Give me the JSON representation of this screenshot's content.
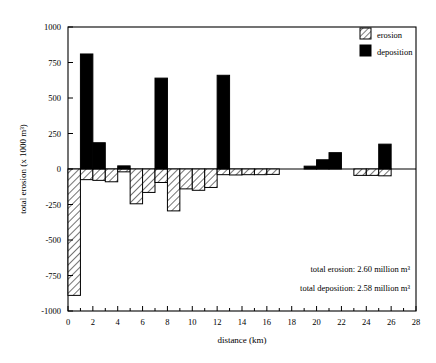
{
  "chart_data": {
    "type": "bar",
    "title": "",
    "xlabel": "distance (km)",
    "ylabel": "total erosion (x 1000 m³)",
    "xlim": [
      0,
      28
    ],
    "ylim": [
      -1000,
      1000
    ],
    "xticks": [
      0,
      2,
      4,
      6,
      8,
      10,
      12,
      14,
      16,
      18,
      20,
      22,
      24,
      26,
      28
    ],
    "xtick_labels": [
      "0",
      "2",
      "4",
      "6",
      "8",
      "10",
      "12",
      "14",
      "16",
      "18",
      "20",
      "22",
      "24",
      "26",
      "28"
    ],
    "xminor_step": 1,
    "yticks": [
      1000,
      750,
      500,
      250,
      0,
      -250,
      -500,
      -750,
      -1000
    ],
    "ytick_labels": [
      "1000",
      "750",
      "500",
      "250",
      "0",
      "-250",
      "-500",
      "-750",
      "-1000"
    ],
    "grid": false,
    "legend_position": "top-right",
    "bar_width_km": 1,
    "series": [
      {
        "name": "erosion",
        "style": "hatched",
        "fill": "#ffffff",
        "edge": "#000000",
        "hatch": "diagonal",
        "bars": [
          {
            "x": 0,
            "value": -890
          },
          {
            "x": 1,
            "value": -75
          },
          {
            "x": 2,
            "value": -80
          },
          {
            "x": 3,
            "value": -90
          },
          {
            "x": 4,
            "value": -20
          },
          {
            "x": 5,
            "value": -245
          },
          {
            "x": 6,
            "value": -165
          },
          {
            "x": 7,
            "value": -95
          },
          {
            "x": 8,
            "value": -295
          },
          {
            "x": 9,
            "value": -140
          },
          {
            "x": 10,
            "value": -150
          },
          {
            "x": 11,
            "value": -130
          },
          {
            "x": 12,
            "value": -40
          },
          {
            "x": 13,
            "value": -42
          },
          {
            "x": 14,
            "value": -40
          },
          {
            "x": 15,
            "value": -40
          },
          {
            "x": 16,
            "value": -38
          },
          {
            "x": 23,
            "value": -45
          },
          {
            "x": 24,
            "value": -45
          },
          {
            "x": 25,
            "value": -48
          }
        ]
      },
      {
        "name": "deposition",
        "style": "solid",
        "fill": "#000000",
        "edge": "#000000",
        "bars": [
          {
            "x": 1,
            "value": 810
          },
          {
            "x": 2,
            "value": 185
          },
          {
            "x": 4,
            "value": 22
          },
          {
            "x": 7,
            "value": 640
          },
          {
            "x": 12,
            "value": 660
          },
          {
            "x": 19,
            "value": 20
          },
          {
            "x": 20,
            "value": 65
          },
          {
            "x": 21,
            "value": 115
          },
          {
            "x": 25,
            "value": 175
          }
        ]
      }
    ],
    "annotations": [
      {
        "text": "total erosion:  2.60 million m³"
      },
      {
        "text": "total deposition:  2.58 million m³"
      }
    ]
  },
  "legend": {
    "items": [
      {
        "label": "erosion",
        "swatch": "hatched"
      },
      {
        "label": "deposition",
        "swatch": "solid"
      }
    ]
  },
  "axes": {
    "y_title": "total erosion (x 1000 m³)",
    "x_title": "distance (km)"
  }
}
